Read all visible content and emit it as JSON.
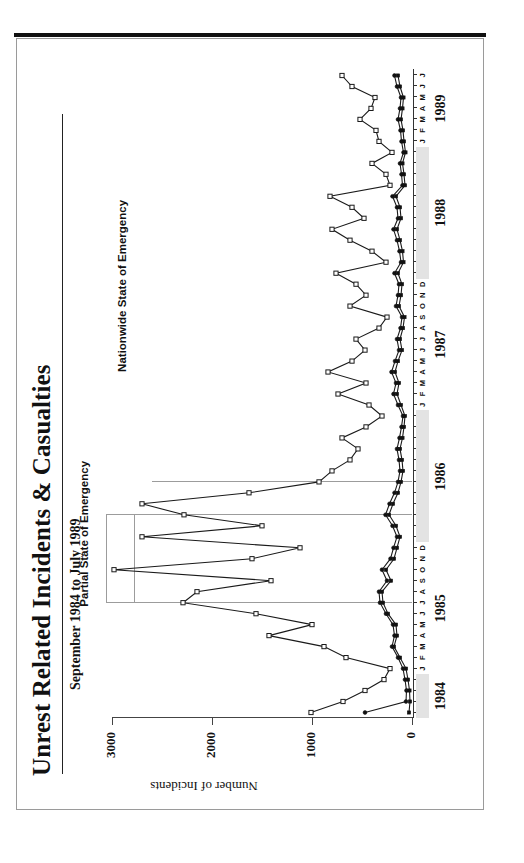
{
  "figure": {
    "title": "Unrest Related Incidents & Casualties",
    "subtitle": "September 1984 to July 1989",
    "orientation": "rotated-90-ccw"
  },
  "annotations": [
    {
      "id": "partial",
      "label": "Partial State of Emergency"
    },
    {
      "id": "nationwide",
      "label": "Nationwide State of Emergency"
    }
  ],
  "chart_data": {
    "type": "line",
    "title": "Unrest Related Incidents & Casualties",
    "subtitle": "September 1984 to July 1989",
    "xlabel": "",
    "ylabel": "Number of Incidents",
    "ylim": [
      0,
      3000
    ],
    "yticks": [
      0,
      1000,
      2000,
      3000
    ],
    "ytick_labels": [
      "0",
      "1000",
      "2000",
      "3000"
    ],
    "grid": false,
    "legend": "none",
    "year_labels": [
      "1984",
      "1985",
      "1986",
      "1987",
      "1988",
      "1989"
    ],
    "month_letters": [
      "S",
      "O",
      "N",
      "D",
      "J",
      "F",
      "M",
      "A",
      "M",
      "J",
      "J",
      "A",
      "S",
      "O",
      "N",
      "D",
      "J",
      "F",
      "M",
      "A",
      "M",
      "J",
      "J",
      "A",
      "S",
      "O",
      "N",
      "D",
      "J",
      "F",
      "M",
      "A",
      "M",
      "J",
      "J",
      "A",
      "S",
      "O",
      "N",
      "D",
      "J",
      "F",
      "M",
      "A",
      "M",
      "J",
      "J",
      "A",
      "S",
      "O",
      "N",
      "D",
      "J",
      "F",
      "M",
      "A",
      "M",
      "J",
      "J"
    ],
    "x": [
      "1984-09",
      "1984-10",
      "1984-11",
      "1984-12",
      "1985-01",
      "1985-02",
      "1985-03",
      "1985-04",
      "1985-05",
      "1985-06",
      "1985-07",
      "1985-08",
      "1985-09",
      "1985-10",
      "1985-11",
      "1985-12",
      "1986-01",
      "1986-02",
      "1986-03",
      "1986-04",
      "1986-05",
      "1986-06",
      "1986-07",
      "1986-08",
      "1986-09",
      "1986-10",
      "1986-11",
      "1986-12",
      "1987-01",
      "1987-02",
      "1987-03",
      "1987-04",
      "1987-05",
      "1987-06",
      "1987-07",
      "1987-08",
      "1987-09",
      "1987-10",
      "1987-11",
      "1987-12",
      "1988-01",
      "1988-02",
      "1988-03",
      "1988-04",
      "1988-05",
      "1988-06",
      "1988-07",
      "1988-08",
      "1988-09",
      "1988-10",
      "1988-11",
      "1988-12",
      "1989-01",
      "1989-02",
      "1989-03",
      "1989-04",
      "1989-05",
      "1989-06",
      "1989-07"
    ],
    "series": [
      {
        "name": "Incidents",
        "marker": "open-square",
        "values": [
          1010,
          690,
          470,
          280,
          220,
          660,
          880,
          1430,
          1000,
          1560,
          2290,
          2150,
          1410,
          2980,
          1600,
          1120,
          2700,
          1500,
          2280,
          2700,
          1630,
          930,
          800,
          620,
          540,
          700,
          460,
          300,
          430,
          740,
          460,
          840,
          600,
          470,
          560,
          330,
          250,
          620,
          460,
          560,
          760,
          260,
          400,
          620,
          800,
          480,
          600,
          820,
          220,
          260,
          400,
          200,
          330,
          360,
          520,
          410,
          370,
          600,
          700
        ]
      },
      {
        "name": "Casualties (deaths)",
        "marker": "filled-square",
        "values": [
          30,
          20,
          25,
          40,
          60,
          120,
          180,
          150,
          160,
          240,
          290,
          300,
          210,
          260,
          180,
          150,
          120,
          160,
          230,
          190,
          140,
          110,
          90,
          100,
          120,
          95,
          80,
          70,
          110,
          150,
          130,
          170,
          140,
          100,
          120,
          90,
          75,
          130,
          110,
          100,
          140,
          85,
          95,
          120,
          150,
          110,
          120,
          160,
          70,
          80,
          95,
          65,
          80,
          90,
          110,
          95,
          85,
          120,
          140
        ]
      },
      {
        "name": "Injuries",
        "marker": "filled-circle",
        "values": [
          470,
          60,
          55,
          70,
          90,
          140,
          200,
          175,
          190,
          260,
          320,
          330,
          250,
          300,
          215,
          185,
          150,
          195,
          265,
          225,
          175,
          140,
          120,
          130,
          150,
          125,
          105,
          90,
          140,
          185,
          160,
          205,
          170,
          130,
          150,
          115,
          100,
          160,
          140,
          130,
          175,
          110,
          125,
          150,
          185,
          140,
          150,
          195,
          95,
          105,
          120,
          85,
          105,
          115,
          140,
          120,
          110,
          150,
          175
        ]
      }
    ],
    "emergency_periods": [
      {
        "label": "Partial State of Emergency",
        "start": "1985-07",
        "end": "1986-03"
      },
      {
        "label": "Nationwide State of Emergency",
        "start": "1986-06",
        "end": "1989-07"
      }
    ]
  }
}
